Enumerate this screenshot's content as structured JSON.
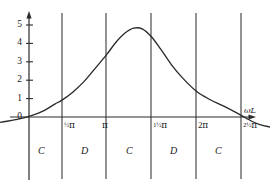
{
  "chart_data": {
    "type": "line",
    "title": "",
    "xlabel": "ωL",
    "ylabel": "",
    "xlim": [
      -0.6,
      2.9
    ],
    "ylim": [
      -0.85,
      5.4
    ],
    "grid": false,
    "legend": null,
    "x_unit": "pi",
    "xticks": [
      0.5,
      1.0,
      1.5,
      2.0,
      2.5
    ],
    "xticklabels": [
      "½π",
      "π",
      "1½π",
      "2π",
      "2½π"
    ],
    "yticks": [
      0,
      1,
      2,
      3,
      4,
      5
    ],
    "yticklabels": [
      "0",
      "1",
      "2",
      "3",
      "4",
      "5"
    ],
    "vertical_lines_at": [
      0.5,
      1.0,
      1.5,
      2.0,
      2.5
    ],
    "region_labels": [
      "C",
      "D",
      "C",
      "D",
      "C"
    ],
    "series": [
      {
        "name": "reactance",
        "x": [
          -0.6,
          -0.45,
          -0.3,
          -0.15,
          0.0,
          0.15,
          0.3,
          0.42,
          0.5,
          0.62,
          0.75,
          0.88,
          1.0,
          1.1,
          1.2,
          1.3,
          1.4,
          1.5,
          1.6,
          1.72,
          1.85,
          2.0,
          2.15,
          2.3,
          2.45,
          2.55,
          2.7,
          2.9
        ],
        "values": [
          -0.62,
          -0.5,
          -0.38,
          -0.26,
          -0.13,
          0.06,
          0.35,
          0.7,
          0.92,
          1.35,
          1.95,
          2.7,
          3.4,
          4.05,
          4.55,
          4.83,
          4.78,
          4.35,
          3.7,
          2.85,
          2.1,
          1.4,
          0.95,
          0.6,
          0.22,
          -0.05,
          -0.4,
          -0.62
        ]
      }
    ]
  },
  "axis": {
    "x_axis_title": "ωL",
    "y_tick_labels": [
      "0",
      "1",
      "2",
      "3",
      "4",
      "5"
    ],
    "x_tick_labels": [
      {
        "frac": "½",
        "pi": "π",
        "full": "½π"
      },
      {
        "frac": "",
        "pi": "π",
        "full": "π"
      },
      {
        "frac": "1½",
        "pi": "π",
        "full": "1½π"
      },
      {
        "frac": "2",
        "pi": "π",
        "full": "2π"
      },
      {
        "frac": "2½",
        "pi": "π",
        "full": "2½π"
      }
    ]
  },
  "regions": [
    {
      "label": "C"
    },
    {
      "label": "D"
    },
    {
      "label": "C"
    },
    {
      "label": "D"
    },
    {
      "label": "C"
    }
  ],
  "colors": {
    "curve": "#2b2b2b",
    "axis": "#2b2b2b",
    "divider": "#3a3a3a",
    "text": "#1a1a1a",
    "background": "#ffffff"
  }
}
